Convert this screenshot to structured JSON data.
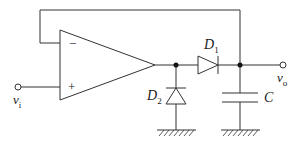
{
  "diagram": {
    "type": "circuit",
    "components": {
      "opamp": {
        "minus": "−",
        "plus": "+"
      },
      "input": {
        "label": "v",
        "sub": "i"
      },
      "output": {
        "label": "v",
        "sub": "o"
      },
      "d1": {
        "label": "D",
        "sub": "1"
      },
      "d2": {
        "label": "D",
        "sub": "2"
      },
      "cap": {
        "label": "C"
      }
    },
    "colors": {
      "stroke": "#333333",
      "background": "#ffffff"
    }
  }
}
